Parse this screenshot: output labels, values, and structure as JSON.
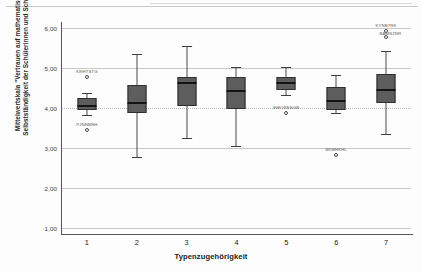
{
  "chart_data": {
    "type": "box",
    "title": "",
    "xlabel": "Typenzugehörigkeit",
    "ylabel": "Mittelwertskala \"Vertrauen auf mathematische Selbstständigkeit der Schülerinnen und Schüler\"",
    "categories": [
      "1",
      "2",
      "3",
      "4",
      "5",
      "6",
      "7"
    ],
    "ylim": [
      1.0,
      6.0
    ],
    "yticks": [
      "1,00",
      "2,00",
      "3,00",
      "4,00",
      "5,00",
      "6,00"
    ],
    "ytick_values": [
      1.0,
      2.0,
      3.0,
      4.0,
      5.0,
      6.0
    ],
    "grid": true,
    "legend": null,
    "boxes": [
      {
        "category": "1",
        "whisker_low": 3.82,
        "q1": 3.95,
        "median": 4.05,
        "q3": 4.25,
        "whisker_high": 4.38,
        "outliers": [
          {
            "value": 4.78,
            "label": "KRHTSTG"
          },
          {
            "value": 3.46,
            "label": "PJNNBNH"
          }
        ]
      },
      {
        "category": "2",
        "whisker_low": 2.78,
        "q1": 3.88,
        "median": 4.12,
        "q3": 4.58,
        "whisker_high": 5.35,
        "outliers": []
      },
      {
        "category": "3",
        "whisker_low": 3.25,
        "q1": 4.05,
        "median": 4.62,
        "q3": 4.78,
        "whisker_high": 5.55,
        "outliers": []
      },
      {
        "category": "4",
        "whisker_low": 3.05,
        "q1": 3.98,
        "median": 4.42,
        "q3": 4.78,
        "whisker_high": 5.02,
        "outliers": []
      },
      {
        "category": "5",
        "whisker_low": 4.32,
        "q1": 4.45,
        "median": 4.62,
        "q3": 4.78,
        "whisker_high": 5.02,
        "outliers": [
          {
            "value": 3.88,
            "label": "EMORESGB"
          }
        ]
      },
      {
        "category": "6",
        "whisker_low": 3.88,
        "q1": 3.95,
        "median": 4.18,
        "q3": 4.52,
        "whisker_high": 4.82,
        "outliers": [
          {
            "value": 2.82,
            "label": "SKMHKHL"
          }
        ]
      },
      {
        "category": "7",
        "whisker_low": 3.35,
        "q1": 4.12,
        "median": 4.45,
        "q3": 4.85,
        "whisker_high": 5.42,
        "outliers": [
          {
            "value": 5.92,
            "label": "KYNB7RK"
          },
          {
            "value": 5.78,
            "label": "BAMS2NR"
          }
        ]
      }
    ]
  },
  "axis": {
    "y_title": "Mittelwertskala \"Vertrauen auf mathematische Selbstständigkeit der Schülerinnen und Schüler\"",
    "x_title": "Typenzugehörigkeit"
  },
  "colors": {
    "box_fill": "#5d5d5d",
    "box_border": "#2f2f2f",
    "median": "#141414",
    "whisker": "#4a4a4a",
    "gridline": "#c9c9c9",
    "axis": "#595959",
    "background": "#fdfdfd",
    "text": "#2b2b2b"
  }
}
